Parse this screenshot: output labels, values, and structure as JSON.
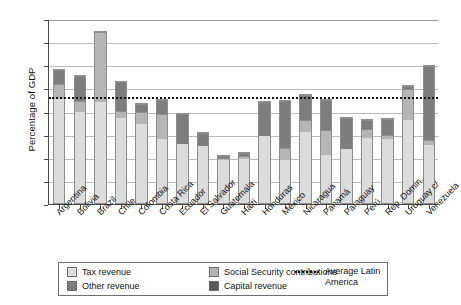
{
  "chart_data": {
    "type": "bar",
    "stacked": true,
    "title": "",
    "xlabel": "",
    "ylabel": "Percentage of GDP",
    "ylim": [
      0,
      40
    ],
    "yticks": [
      0,
      5,
      10,
      15,
      20,
      25,
      30,
      35,
      40
    ],
    "grid": true,
    "legend_position": "bottom",
    "categories": [
      "Argentina",
      "Bolivia",
      "Brazil",
      "Chile",
      "Colombia",
      "Costa Rica",
      "Ecuador",
      "El Salvador",
      "Guatemala",
      "Haití",
      "Honduras",
      "México",
      "Nicaragua",
      "Panamá",
      "Paraguay",
      "Perú",
      "Rep. Domin.",
      "Uruguay c/",
      "Venezuela"
    ],
    "series": [
      {
        "name": "Tax revenue",
        "color": "#dcdcdc",
        "values": [
          23.1,
          20.4,
          22.2,
          18.9,
          17.7,
          14.3,
          13.2,
          12.8,
          10.1,
          10.4,
          14.9,
          9.6,
          16.0,
          10.7,
          12.0,
          14.7,
          14.6,
          18.5,
          12.9
        ]
      },
      {
        "name": "Social Security contributions",
        "color": "#b5b5b5",
        "values": [
          3.2,
          2.2,
          15.2,
          1.4,
          2.6,
          5.4,
          0.0,
          0.0,
          0.3,
          0.3,
          0.0,
          2.6,
          2.3,
          5.4,
          0.0,
          1.8,
          0.5,
          6.7,
          0.8
        ]
      },
      {
        "name": "Other revenue",
        "color": "#7d7d7d",
        "values": [
          2.9,
          5.3,
          0.0,
          6.3,
          1.5,
          3.0,
          6.5,
          2.7,
          0.2,
          0.6,
          7.4,
          10.3,
          5.4,
          6.6,
          6.9,
          1.8,
          3.4,
          0.6,
          16.3
        ]
      },
      {
        "name": "Capital revenue",
        "color": "#5a5a5a",
        "values": [
          0.0,
          0.0,
          0.0,
          0.0,
          0.0,
          0.0,
          0.0,
          0.0,
          0.0,
          0.0,
          0.0,
          0.0,
          0.0,
          0.0,
          0.0,
          0.0,
          0.0,
          0.0,
          0.0
        ]
      }
    ],
    "totals": [
      29.2,
      27.9,
      37.4,
      26.6,
      21.8,
      22.7,
      19.7,
      15.5,
      10.6,
      11.3,
      22.3,
      22.5,
      23.7,
      22.7,
      18.9,
      18.3,
      18.5,
      25.8,
      30.0
    ],
    "reference_line": {
      "label": "Average Latin America",
      "value": 23.4,
      "style": "dotted"
    }
  },
  "legend": {
    "items": [
      {
        "label": "Tax revenue",
        "swatch": "tax"
      },
      {
        "label": "Social Security contributions",
        "swatch": "ssc"
      },
      {
        "label": "Other revenue",
        "swatch": "other"
      },
      {
        "label": "Capital revenue",
        "swatch": "capital"
      }
    ],
    "reference_label_line1": "Average Latin",
    "reference_label_line2": "America"
  }
}
